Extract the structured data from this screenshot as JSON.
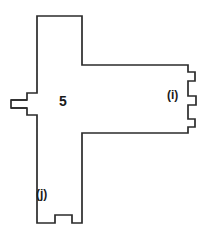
{
  "figure": {
    "type": "technical-line-drawing",
    "background_color": "#ffffff",
    "line_color": "#2b2b2b",
    "line_width": 1.7,
    "canvas": {
      "width": 208,
      "height": 239
    },
    "labels": {
      "part_number": "5",
      "feature_i": "(i)",
      "feature_j": "(j)"
    },
    "outline_points": "37,16 82,16 82,65 188,65 188,72 195,72 195,81 188,81 188,96 196,96 196,105 188,105 188,119 195,119 195,127 188,127 188,133 82,133 82,223 72,223 72,215 55,215 55,223 37,223 37,115 27,115 27,108 11,108 11,100 27,100 27,93 37,93",
    "detail_lines": [
      {
        "name": "left-slot-upper",
        "d": "M 11 100 L 27 100"
      },
      {
        "name": "left-slot-lower",
        "d": "M 11 108 L 27 108"
      }
    ]
  }
}
